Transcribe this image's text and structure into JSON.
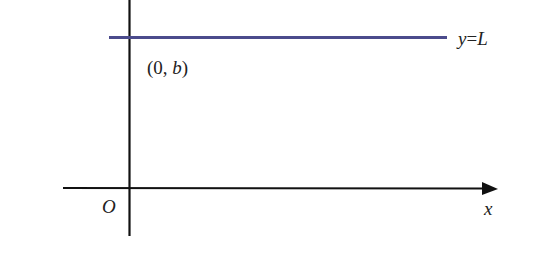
{
  "diagram": {
    "type": "coordinate-axes-horizontal-line",
    "colors": {
      "axes": "#111111",
      "line": "#4b4b8c",
      "text": "#222222"
    },
    "labels": {
      "point": "(0, b)",
      "point_prefix": "(0, ",
      "point_var": "b",
      "point_suffix": ")",
      "line_eq_y": "y",
      "line_eq_eq": "=",
      "line_eq_L": "L",
      "origin": "O",
      "x_axis": "x"
    }
  }
}
